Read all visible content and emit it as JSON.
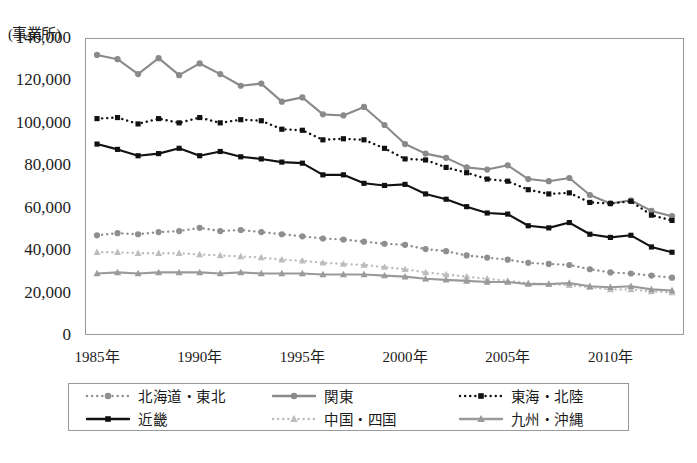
{
  "figure": {
    "unit_label": "(事業所)",
    "caption": ""
  },
  "axes": {
    "y_ticks": [
      "140,000",
      "120,000",
      "100,000",
      "80,000",
      "60,000",
      "40,000",
      "20,000",
      "0"
    ],
    "x_ticks": [
      "1985年",
      "1990年",
      "1995年",
      "2000年",
      "2005年",
      "2010年"
    ]
  },
  "legend": {
    "items": [
      {
        "label": "北海道・東北",
        "style": "dotted",
        "marker": "circle",
        "color": "#8f8f8f"
      },
      {
        "label": "関東",
        "style": "solid",
        "marker": "circle",
        "color": "#8a8a8a"
      },
      {
        "label": "東海・北陸",
        "style": "dotted",
        "marker": "square",
        "color": "#111111"
      },
      {
        "label": "近畿",
        "style": "solid",
        "marker": "square",
        "color": "#111111"
      },
      {
        "label": "中国・四国",
        "style": "dotted",
        "marker": "triangle",
        "color": "#bdbdbd"
      },
      {
        "label": "九州・沖縄",
        "style": "solid",
        "marker": "triangle",
        "color": "#9a9a9a"
      }
    ]
  },
  "chart_data": {
    "type": "line",
    "title": "",
    "xlabel": "",
    "ylabel": "(事業所)",
    "ylim": [
      0,
      140000
    ],
    "ytick_step": 20000,
    "grid": false,
    "legend_position": "bottom",
    "x": [
      1985,
      1986,
      1987,
      1988,
      1989,
      1990,
      1991,
      1992,
      1993,
      1994,
      1995,
      1996,
      1997,
      1998,
      1999,
      2000,
      2001,
      2002,
      2003,
      2004,
      2005,
      2006,
      2007,
      2008,
      2009,
      2010,
      2011,
      2012,
      2013
    ],
    "x_tick_labels": [
      "1985年",
      "1990年",
      "1995年",
      "2000年",
      "2005年",
      "2010年"
    ],
    "x_tick_values": [
      1985,
      1990,
      1995,
      2000,
      2005,
      2010
    ],
    "series": [
      {
        "name": "関東",
        "color": "#8a8a8a",
        "style": "solid",
        "marker": "circle",
        "values": [
          132000,
          130000,
          123000,
          130500,
          122500,
          128000,
          123000,
          117500,
          118500,
          110000,
          112000,
          104000,
          103500,
          107500,
          99000,
          90000,
          85500,
          83500,
          79000,
          78000,
          80000,
          73500,
          72500,
          74000,
          66000,
          62000,
          63500,
          58500,
          56000
        ]
      },
      {
        "name": "東海・北陸",
        "color": "#111111",
        "style": "dotted",
        "marker": "square",
        "values": [
          102000,
          102500,
          99500,
          102000,
          100000,
          102500,
          100000,
          101500,
          101000,
          97000,
          96500,
          92000,
          92500,
          92000,
          88000,
          83000,
          82500,
          79000,
          76500,
          73500,
          72500,
          68500,
          66500,
          67000,
          62500,
          62000,
          63000,
          56500,
          54000
        ]
      },
      {
        "name": "近畿",
        "color": "#111111",
        "style": "solid",
        "marker": "square",
        "values": [
          90000,
          87500,
          84500,
          85500,
          88000,
          84500,
          86500,
          84000,
          83000,
          81500,
          81000,
          75500,
          75500,
          71500,
          70500,
          71000,
          66500,
          64000,
          60500,
          57500,
          57000,
          51500,
          50500,
          53000,
          47500,
          46000,
          47000,
          41500,
          39000
        ]
      },
      {
        "name": "北海道・東北",
        "color": "#8f8f8f",
        "style": "dotted",
        "marker": "circle",
        "values": [
          47000,
          48000,
          47500,
          48500,
          49000,
          50500,
          49000,
          49500,
          48500,
          47500,
          46500,
          45500,
          45000,
          44000,
          43000,
          42500,
          40500,
          39500,
          37500,
          36500,
          35500,
          34000,
          33500,
          33000,
          31000,
          29500,
          29000,
          28000,
          27000
        ]
      },
      {
        "name": "中国・四国",
        "color": "#bdbdbd",
        "style": "dotted",
        "marker": "triangle",
        "values": [
          39000,
          39000,
          38500,
          38500,
          38500,
          38000,
          37500,
          37000,
          36500,
          35500,
          35000,
          34000,
          33500,
          33000,
          32000,
          31000,
          29500,
          28500,
          27500,
          26500,
          25500,
          24500,
          24000,
          23500,
          22500,
          21500,
          21500,
          20500,
          20000
        ]
      },
      {
        "name": "九州・沖縄",
        "color": "#9a9a9a",
        "style": "solid",
        "marker": "triangle",
        "values": [
          29000,
          29500,
          29000,
          29500,
          29500,
          29500,
          29000,
          29500,
          29000,
          29000,
          29000,
          28500,
          28500,
          28500,
          28000,
          27500,
          26500,
          26000,
          25500,
          25000,
          25000,
          24000,
          24000,
          24500,
          23000,
          22500,
          23000,
          21500,
          21000
        ]
      }
    ]
  }
}
